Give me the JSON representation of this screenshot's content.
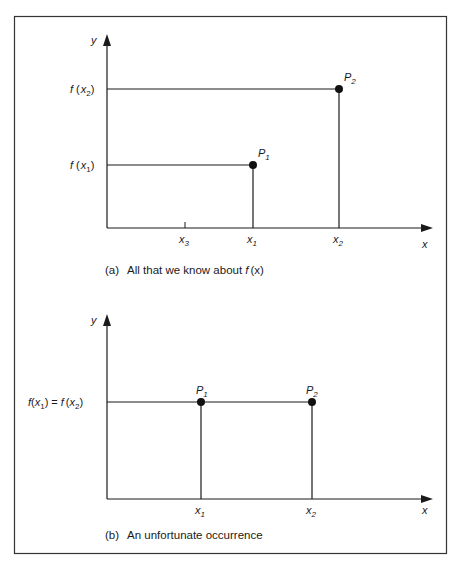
{
  "colors": {
    "ink": "#1a1a1a",
    "background": "#ffffff"
  },
  "figure": {
    "panel_a": {
      "caption_tag": "(a)",
      "caption_text": "All that we know about ",
      "caption_func": "f",
      "caption_arg": "(x)",
      "y_axis_label": "y",
      "x_axis_label": "x",
      "y_labels": {
        "f_x2": {
          "f": "f",
          "open": "(",
          "x": "x",
          "sub": "2",
          "close": ")"
        },
        "f_x1": {
          "f": "f",
          "open": "(",
          "x": "x",
          "sub": "1",
          "close": ")"
        }
      },
      "x_ticks": [
        {
          "x": "x",
          "sub": "3"
        },
        {
          "x": "x",
          "sub": "1"
        },
        {
          "x": "x",
          "sub": "2"
        }
      ],
      "points": [
        {
          "P": "P",
          "sub": "1"
        },
        {
          "P": "P",
          "sub": "2"
        }
      ]
    },
    "panel_b": {
      "caption_tag": "(b)",
      "caption_text": "An unfortunate occurrence",
      "y_axis_label": "y",
      "x_axis_label": "x",
      "y_label_left": {
        "f1": "f",
        "x1": "x",
        "s1": "1",
        "eq": "=",
        "f2": "f",
        "x2": "x",
        "s2": "2"
      },
      "x_ticks": [
        {
          "x": "x",
          "sub": "1"
        },
        {
          "x": "x",
          "sub": "2"
        }
      ],
      "points": [
        {
          "P": "P",
          "sub": "1"
        },
        {
          "P": "P",
          "sub": "2"
        }
      ]
    }
  }
}
